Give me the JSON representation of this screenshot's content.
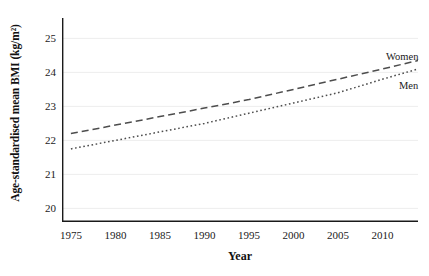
{
  "chart_data": {
    "type": "line",
    "title": "",
    "subtitle": "",
    "xlabel": "Year",
    "ylabel": "Age-standardised mean BMI (kg/m²)",
    "xlim": [
      1974,
      2014
    ],
    "ylim": [
      19.6,
      25.6
    ],
    "xticks": [
      1975,
      1980,
      1985,
      1990,
      1995,
      2000,
      2005,
      2010
    ],
    "yticks": [
      20,
      21,
      22,
      23,
      24,
      25
    ],
    "xtick_labels": [
      "1975",
      "1980",
      "1985",
      "1990",
      "1995",
      "2000",
      "2005",
      "2010"
    ],
    "ytick_labels": [
      "20",
      "21",
      "22",
      "23",
      "24",
      "25"
    ],
    "grid": "horizontal-faint",
    "legend_position": "inline-right-annotations",
    "x": [
      1975,
      1980,
      1985,
      1990,
      1995,
      2000,
      2005,
      2010,
      2014
    ],
    "series": [
      {
        "name": "Women",
        "style": "dashed",
        "color": "#4d4d4d",
        "values": [
          22.2,
          22.45,
          22.7,
          22.95,
          23.2,
          23.5,
          23.8,
          24.1,
          24.35
        ]
      },
      {
        "name": "Men",
        "style": "dotted",
        "color": "#4d4d4d",
        "values": [
          21.75,
          22.0,
          22.25,
          22.5,
          22.8,
          23.1,
          23.4,
          23.8,
          24.1
        ]
      }
    ],
    "annotations": [
      {
        "text": "Women",
        "x": 2012,
        "y": 24.9
      },
      {
        "text": "Men",
        "x": 2013,
        "y": 23.9
      }
    ]
  },
  "axis": {
    "spine_color": "#1a1a1a",
    "grid_color": "#ededed"
  }
}
